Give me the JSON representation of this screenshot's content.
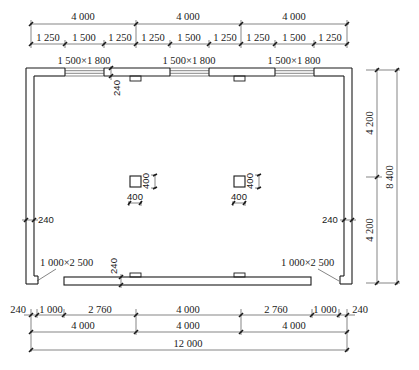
{
  "drawing": {
    "type": "floor-plan",
    "units": "mm",
    "top_dims": {
      "overall_segments": [
        "4 000",
        "4 000",
        "4 000"
      ],
      "detail_segments": [
        "1 250",
        "1 500",
        "1 250",
        "1 250",
        "1 500",
        "1 250",
        "1 250",
        "1 500",
        "1 250"
      ]
    },
    "windows": [
      {
        "label": "1 500×1 800"
      },
      {
        "label": "1 500×1 800"
      },
      {
        "label": "1 500×1 800"
      }
    ],
    "doors": [
      {
        "label": "1 000×2 500"
      },
      {
        "label": "1 000×2 500"
      }
    ],
    "wall_thickness_labels": {
      "top": "240",
      "left": "240",
      "right": "240",
      "bottom": "240"
    },
    "columns": [
      {
        "width": "400",
        "depth": "400"
      },
      {
        "width": "400",
        "depth": "400"
      }
    ],
    "right_dims": {
      "segments": [
        "4 200",
        "4 200"
      ],
      "overall": "8 400"
    },
    "bottom_dims": {
      "detail_segments": [
        "240",
        "1 000",
        "2 760",
        "4 000",
        "2 760",
        "1 000",
        "240"
      ],
      "axis_segments": [
        "4 000",
        "4 000",
        "4 000"
      ],
      "overall": "12 000"
    }
  }
}
